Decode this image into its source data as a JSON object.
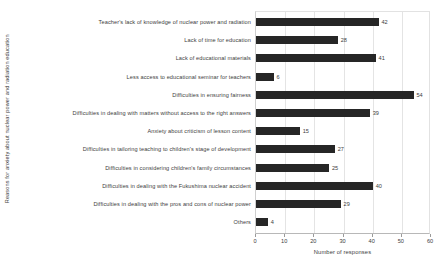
{
  "chart_data": {
    "type": "bar",
    "orientation": "horizontal",
    "title": "",
    "xlabel": "Number of responses",
    "ylabel": "Reasons for anxiety about nuclear power and radiation education",
    "xlim": [
      0,
      60
    ],
    "xticks": [
      0,
      10,
      20,
      30,
      40,
      50,
      60
    ],
    "grid": true,
    "legend": false,
    "bar_color": "#262626",
    "categories": [
      "Teacher's lack of knowledge of nuclear power and radiation",
      "Lack of time for education",
      "Lack of educational materials",
      "Less access to educational seminar for teachers",
      "Difficulties in ensuring fairness",
      "Difficulties in dealing with matters without access to the right answers",
      "Anxiety about criticism of lesson content",
      "Difficulties in tailoring teaching to children's stage of development",
      "Difficulties in considering children's family circumstances",
      "Difficulties in dealing with the Fukushima nuclear accident",
      "Difficulties in dealing with the pros and cons of nuclear power",
      "Others"
    ],
    "values": [
      42,
      28,
      41,
      6,
      54,
      39,
      15,
      27,
      25,
      40,
      29,
      4
    ],
    "data_labels": [
      "42",
      "28",
      "41",
      "6",
      "54",
      "39",
      "15",
      "27",
      "25",
      "40",
      "29",
      "4"
    ]
  }
}
